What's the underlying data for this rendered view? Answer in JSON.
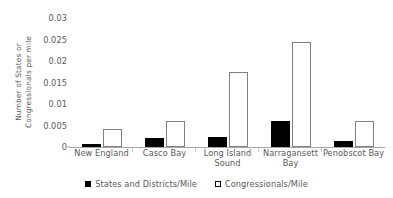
{
  "chart_data": {
    "type": "bar",
    "title": "",
    "xlabel": "",
    "ylabel": "Number of States or Congressionals per mile",
    "ylim": [
      0,
      0.03
    ],
    "grid": false,
    "legend_position": "bottom",
    "categories": [
      "New England",
      "Casco Bay",
      "Long Island\nSound",
      "Narragansett\nBay",
      "Penobscot Bay"
    ],
    "ytick_labels": [
      "0.03",
      "0.025",
      "0.02",
      "0.015",
      "0.01",
      "0.005",
      "0"
    ],
    "ytick_values": [
      0.03,
      0.025,
      0.02,
      0.015,
      0.01,
      0.005,
      0
    ],
    "series": [
      {
        "name": "States and Districts/Mile",
        "color": "#000000",
        "values": [
          0.0007,
          0.002,
          0.0024,
          0.0061,
          0.0013
        ]
      },
      {
        "name": "Congressionals/Mile",
        "color": "#ffffff",
        "border_color": "#808080",
        "values": [
          0.0043,
          0.0061,
          0.0175,
          0.0245,
          0.0061
        ]
      }
    ]
  },
  "legend": {
    "items": [
      {
        "label": "States and Districts/Mile",
        "swatch": "filled-black-square"
      },
      {
        "label": "Congressionals/Mile",
        "swatch": "outlined-white-square"
      }
    ]
  },
  "colors": {
    "axis": "#a6a6a6",
    "text": "#595959",
    "series_dark": "#000000",
    "series_light_border": "#808080",
    "background": "#ffffff"
  }
}
